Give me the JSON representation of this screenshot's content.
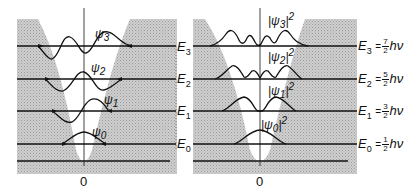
{
  "left_panel": {
    "title": "Wavefunctions",
    "origin_label": "0",
    "wavefunctions": [
      {
        "label": "ψ",
        "sub": "3"
      },
      {
        "label": "ψ",
        "sub": "2"
      },
      {
        "label": "ψ",
        "sub": "1"
      },
      {
        "label": "ψ",
        "sub": "0"
      }
    ],
    "energy_labels": [
      {
        "label": "E",
        "sub": "3"
      },
      {
        "label": "E",
        "sub": "2"
      },
      {
        "label": "E",
        "sub": "1"
      },
      {
        "label": "E",
        "sub": "0"
      }
    ]
  },
  "right_panel": {
    "title": "Probability densities",
    "origin_label": "0",
    "densities": [
      {
        "label": "|ψ",
        "sub": "3",
        "sup": "2"
      },
      {
        "label": "|ψ",
        "sub": "2",
        "sup": "2"
      },
      {
        "label": "|ψ",
        "sub": "1",
        "sup": "2"
      },
      {
        "label": "|ψ",
        "sub": "0",
        "sup": "2"
      }
    ],
    "energy_labels": [
      {
        "label": "E",
        "sub": "3",
        "eq": "=",
        "num": "7",
        "den": "2",
        "unit": "hν"
      },
      {
        "label": "E",
        "sub": "2",
        "eq": "=",
        "num": "5",
        "den": "2",
        "unit": "hν"
      },
      {
        "label": "E",
        "sub": "1",
        "eq": "=",
        "num": "3",
        "den": "2",
        "unit": "hν"
      },
      {
        "label": "E",
        "sub": "0",
        "eq": "=",
        "num": "1",
        "den": "2",
        "unit": "hν"
      }
    ]
  },
  "colors": {
    "shading": "#c8c8c8",
    "line": "#111111",
    "background": "#ffffff"
  }
}
